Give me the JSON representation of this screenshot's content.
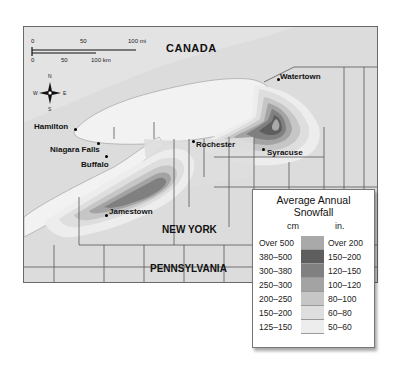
{
  "map": {
    "country_label": "CANADA",
    "states": [
      {
        "name": "NEW YORK"
      },
      {
        "name": "PENNSYLVANIA"
      }
    ],
    "cities": [
      {
        "name": "Watertown"
      },
      {
        "name": "Hamilton"
      },
      {
        "name": "Niagara Falls"
      },
      {
        "name": "Buffalo"
      },
      {
        "name": "Rochester"
      },
      {
        "name": "Syracuse"
      },
      {
        "name": "Jamestown"
      }
    ],
    "scale_bar": {
      "miles": {
        "ticks": [
          "0",
          "50",
          "100 mi"
        ]
      },
      "km": {
        "ticks": [
          "0",
          "50",
          "100 km"
        ]
      }
    },
    "compass": {
      "n": "N",
      "s": "S",
      "e": "E",
      "w": "W"
    },
    "colors": {
      "land": "#dcdcdc",
      "lake": "#f2f2f2",
      "border": "#555555"
    }
  },
  "legend": {
    "title_line1": "Average Annual",
    "title_line2": "Snowfall",
    "unit_cm": "cm",
    "unit_in": "in.",
    "rows": [
      {
        "cm": "Over 500",
        "in": "Over 200",
        "color": "#a9a9a9"
      },
      {
        "cm": "380–500",
        "in": "150–200",
        "color": "#5e5e5e"
      },
      {
        "cm": "300–380",
        "in": "120–150",
        "color": "#808080"
      },
      {
        "cm": "250–300",
        "in": "100–120",
        "color": "#a3a3a3"
      },
      {
        "cm": "200–250",
        "in": "80–100",
        "color": "#c6c6c6"
      },
      {
        "cm": "150–200",
        "in": "60–80",
        "color": "#dedede"
      },
      {
        "cm": "125–150",
        "in": "50–60",
        "color": "#ededed"
      }
    ]
  }
}
